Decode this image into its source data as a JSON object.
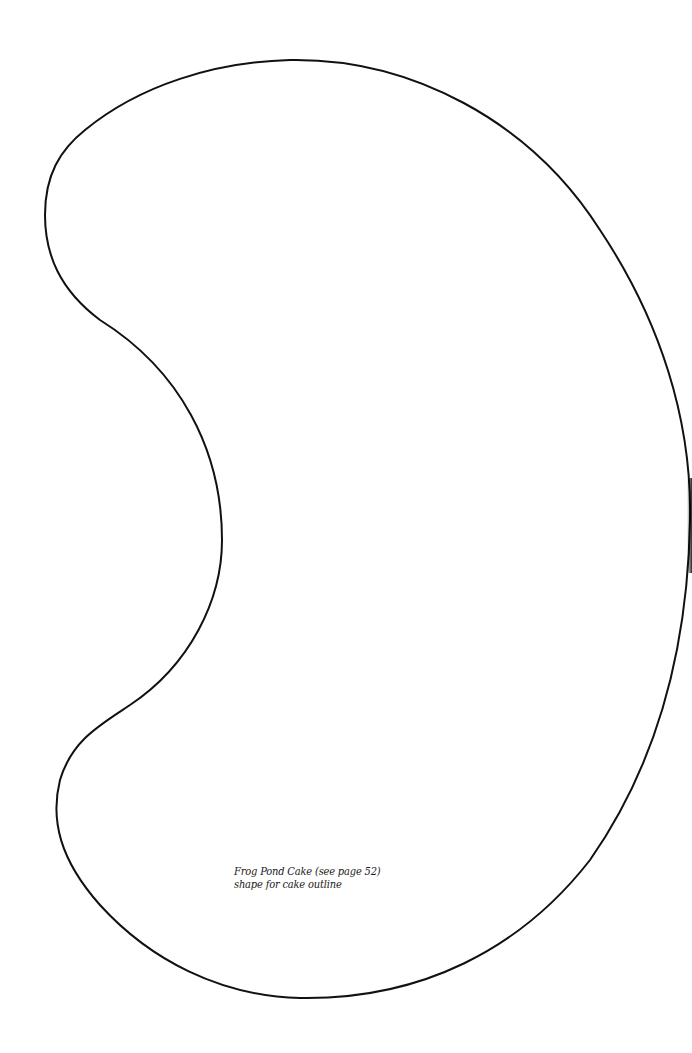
{
  "document": {
    "type": "cake-template-page",
    "background_color": "#ffffff",
    "outline": {
      "shape": "kidney / bean shape",
      "stroke_color": "#111111",
      "stroke_width": 2
    },
    "caption": {
      "line1": "Frog Pond Cake (see page 52)",
      "line2": "shape for cake outline"
    }
  }
}
